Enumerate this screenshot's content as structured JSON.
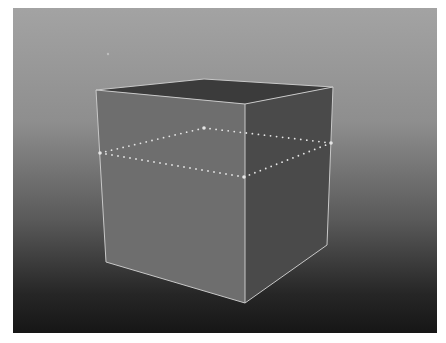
{
  "viewport": {
    "label": "3D perspective viewport",
    "background_top": "#a3a3a3",
    "background_bottom": "#161616"
  },
  "scene": {
    "object": "cube",
    "colors": {
      "top_face": "#3b3b3b",
      "left_face": "#6e6e6e",
      "right_face": "#4a4a4a",
      "edge": "#c8c8c8",
      "edge_loop": "#e6e6e6"
    },
    "vertices": {
      "top_left": [
        96,
        90
      ],
      "top_back": [
        204,
        79
      ],
      "top_right": [
        333,
        87
      ],
      "top_front": [
        245,
        104
      ],
      "bottom_left": [
        106,
        262
      ],
      "bottom_front": [
        245,
        303
      ],
      "bottom_right": [
        327,
        245
      ]
    },
    "edge_loop": {
      "left": [
        100,
        153
      ],
      "back": [
        204,
        128
      ],
      "right": [
        331,
        143
      ],
      "front": [
        244,
        177
      ]
    },
    "stray_point": [
      108,
      54
    ]
  }
}
